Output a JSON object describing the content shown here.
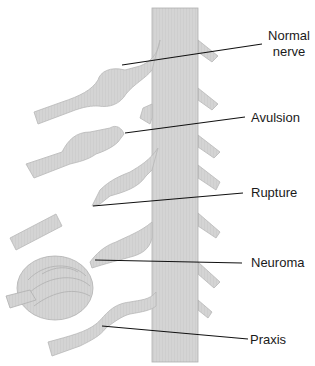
{
  "diagram": {
    "colors": {
      "nerve_fill": "#d6d6d6",
      "nerve_stroke": "#b8b8b8",
      "cord_fill": "#cfcfcf",
      "leader_line": "#111111",
      "background": "#ffffff"
    },
    "labels": [
      {
        "id": "normal",
        "text_line1": "Normal",
        "text_line2": "nerve"
      },
      {
        "id": "avulsion",
        "text": "Avulsion"
      },
      {
        "id": "rupture",
        "text": "Rupture"
      },
      {
        "id": "neuroma",
        "text": "Neuroma"
      },
      {
        "id": "praxis",
        "text": "Praxis"
      }
    ]
  }
}
